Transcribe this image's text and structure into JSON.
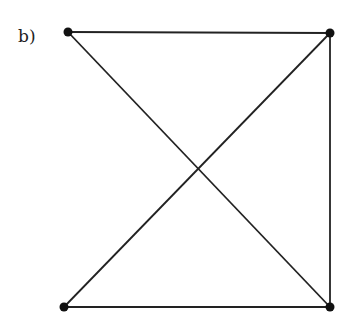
{
  "figure": {
    "label": "b)",
    "graph": {
      "nodes": [
        {
          "id": "top-left",
          "x": 68,
          "y": 32
        },
        {
          "id": "top-right",
          "x": 330,
          "y": 33
        },
        {
          "id": "bottom-left",
          "x": 64,
          "y": 307
        },
        {
          "id": "bottom-right",
          "x": 330,
          "y": 307
        }
      ],
      "edges": [
        [
          "top-left",
          "top-right"
        ],
        [
          "top-left",
          "bottom-right"
        ],
        [
          "top-right",
          "bottom-left"
        ],
        [
          "top-right",
          "bottom-right"
        ],
        [
          "bottom-left",
          "bottom-right"
        ]
      ],
      "line_color": "#222222",
      "node_color": "#111111",
      "node_radius": 4.5
    }
  }
}
